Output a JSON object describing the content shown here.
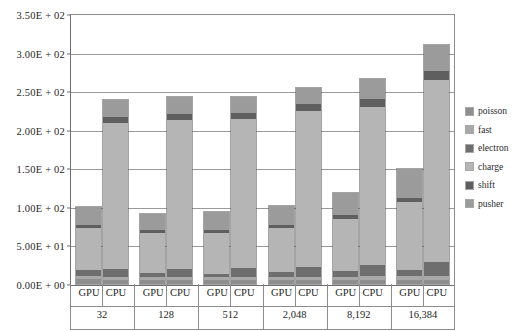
{
  "chart_data": {
    "type": "bar",
    "subtype": "stacked-grouped-column",
    "title": "",
    "subtitle": "",
    "xlabel": "",
    "ylabel": "",
    "ylim": [
      0,
      350
    ],
    "ytick_labels": [
      "0.00E + 00",
      "5.00E + 01",
      "1.00E + 02",
      "1.50E + 02",
      "2.00E + 02",
      "2.50E + 02",
      "3.00E + 02",
      "3.50E + 02"
    ],
    "ytick_values": [
      0,
      50,
      100,
      150,
      200,
      250,
      300,
      350
    ],
    "ytick_step": 50,
    "grid": true,
    "legend_position": "right",
    "legend_entries": [
      "poisson",
      "fast",
      "electron",
      "charge",
      "shift",
      "pusher"
    ],
    "categories": [
      "32",
      "128",
      "512",
      "2,048",
      "8,192",
      "16,384"
    ],
    "subcategories": [
      "GPU",
      "CPU"
    ],
    "series": [
      {
        "name": "poisson",
        "color": "#8e8e8e",
        "values_gpu": [
          6.0,
          5.5,
          5.0,
          5.0,
          5.0,
          5.0
        ],
        "values_cpu": [
          5.0,
          5.0,
          5.0,
          5.0,
          5.0,
          5.0
        ]
      },
      {
        "name": "fast",
        "color": "#a8a8a8",
        "values_gpu": [
          4.0,
          3.5,
          3.5,
          4.0,
          4.5,
          5.0
        ],
        "values_cpu": [
          4.0,
          4.0,
          4.0,
          4.5,
          5.0,
          6.0
        ]
      },
      {
        "name": "electron",
        "color": "#6e6e6e",
        "values_gpu": [
          8.0,
          5.0,
          5.0,
          6.0,
          7.0,
          8.0
        ],
        "values_cpu": [
          10.0,
          11.0,
          12.0,
          13.0,
          15.0,
          18.0
        ]
      },
      {
        "name": "charge",
        "color": "#b5b5b5",
        "values_gpu": [
          55.0,
          52.0,
          53.0,
          57.0,
          68.0,
          88.0
        ],
        "values_cpu": [
          190.0,
          192.0,
          193.0,
          202.0,
          205.0,
          235.0
        ]
      },
      {
        "name": "shift",
        "color": "#5f5f5f",
        "values_gpu": [
          4.0,
          4.0,
          4.0,
          4.0,
          5.0,
          6.0
        ],
        "values_cpu": [
          8.0,
          8.0,
          8.0,
          9.0,
          10.0,
          12.0
        ]
      },
      {
        "name": "pusher",
        "color": "#9b9b9b",
        "values_gpu": [
          23.0,
          21.0,
          22.5,
          25.0,
          29.0,
          37.0
        ],
        "values_cpu": [
          21.0,
          22.0,
          21.0,
          20.0,
          26.0,
          34.0
        ]
      }
    ],
    "totals_gpu": [
      100.0,
      91.0,
      93.0,
      101.0,
      118.5,
      149.0
    ],
    "totals_cpu": [
      238.0,
      242.0,
      243.0,
      253.5,
      266.0,
      310.0
    ]
  },
  "legend": {
    "items": [
      {
        "label": "poisson",
        "color": "#8e8e8e"
      },
      {
        "label": "fast",
        "color": "#a8a8a8"
      },
      {
        "label": "electron",
        "color": "#6e6e6e"
      },
      {
        "label": "charge",
        "color": "#b5b5b5"
      },
      {
        "label": "shift",
        "color": "#5f5f5f"
      },
      {
        "label": "pusher",
        "color": "#9b9b9b"
      }
    ]
  },
  "axes": {
    "y_labels": [
      "3.50E + 02",
      "3.00E + 02",
      "2.50E + 02",
      "2.00E + 02",
      "1.50E + 02",
      "1.00E + 02",
      "5.00E + 01",
      "0.00E + 00"
    ],
    "group_labels": [
      "32",
      "128",
      "512",
      "2,048",
      "8,192",
      "16,384"
    ],
    "sub_labels": [
      "GPU",
      "CPU"
    ]
  },
  "colors": {
    "frame": "#6f6f6f",
    "grid": "#9a9a9a",
    "text": "#262626",
    "background": "#ffffff"
  }
}
